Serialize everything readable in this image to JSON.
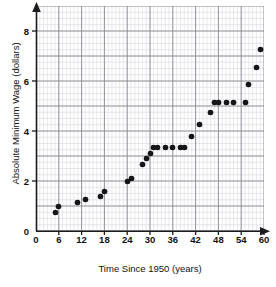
{
  "chart_data": {
    "type": "scatter",
    "title": "",
    "xlabel": "Time Since 1950 (years)",
    "ylabel": "Absolute Minimum Wage (dollars)",
    "xlim": [
      0,
      60
    ],
    "ylim": [
      0,
      9
    ],
    "xticks": [
      0,
      6,
      12,
      18,
      24,
      30,
      36,
      42,
      48,
      54,
      60
    ],
    "yticks": [
      0,
      2,
      4,
      6,
      8
    ],
    "xtick_labels": [
      "0",
      "6",
      "12",
      "18",
      "24",
      "30",
      "36",
      "42",
      "48",
      "54",
      "60"
    ],
    "ytick_labels": [
      "0",
      "2",
      "4",
      "6",
      "8"
    ],
    "grid": true,
    "grid_minor_step_x": 1,
    "grid_minor_step_y": 0.25,
    "grid_major_step_x": 6,
    "grid_major_step_y": 1,
    "legend": null,
    "marker_color": "#16161a",
    "grid_minor_color": "#d8d8de",
    "grid_major_color": "#8a8a93",
    "axis_color": "#1a1a1f",
    "points": [
      {
        "x": 5,
        "y": 0.75
      },
      {
        "x": 6,
        "y": 1.0
      },
      {
        "x": 11,
        "y": 1.15
      },
      {
        "x": 13,
        "y": 1.25
      },
      {
        "x": 17,
        "y": 1.4
      },
      {
        "x": 18,
        "y": 1.6
      },
      {
        "x": 24,
        "y": 2.0
      },
      {
        "x": 25,
        "y": 2.1
      },
      {
        "x": 28,
        "y": 2.65
      },
      {
        "x": 29,
        "y": 2.9
      },
      {
        "x": 30,
        "y": 3.1
      },
      {
        "x": 31,
        "y": 3.35
      },
      {
        "x": 32,
        "y": 3.35
      },
      {
        "x": 34,
        "y": 3.35
      },
      {
        "x": 36,
        "y": 3.35
      },
      {
        "x": 38,
        "y": 3.35
      },
      {
        "x": 39,
        "y": 3.35
      },
      {
        "x": 41,
        "y": 3.8
      },
      {
        "x": 43,
        "y": 4.25
      },
      {
        "x": 46,
        "y": 4.75
      },
      {
        "x": 47,
        "y": 5.15
      },
      {
        "x": 48,
        "y": 5.15
      },
      {
        "x": 50,
        "y": 5.15
      },
      {
        "x": 52,
        "y": 5.15
      },
      {
        "x": 55,
        "y": 5.15
      },
      {
        "x": 56,
        "y": 5.85
      },
      {
        "x": 58,
        "y": 6.55
      },
      {
        "x": 59,
        "y": 7.25
      }
    ]
  }
}
